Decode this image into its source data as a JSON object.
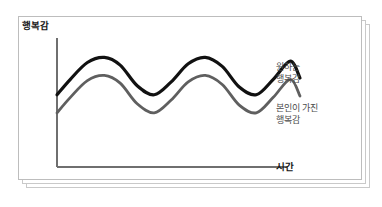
{
  "card": {
    "stack_count": 3,
    "border_color": "#bdbdbd",
    "background": "#ffffff"
  },
  "chart_data": {
    "type": "line",
    "title": "",
    "subtitle": "",
    "xlabel": "시간",
    "ylabel": "행복감",
    "grid": false,
    "legend_position": "right",
    "axis": {
      "x_axis_label": "시간",
      "y_axis_label": "행복감",
      "x_ticks": [],
      "y_ticks": [],
      "xlim": [
        0,
        10
      ],
      "ylim": [
        0,
        10
      ],
      "axis_color": "#6f6f6f"
    },
    "series": [
      {
        "name": "원하는 행복감",
        "name_lines": [
          "원하는",
          "행복감"
        ],
        "color": "#111111",
        "stroke_width": 3.2,
        "x": [
          0,
          0.55,
          1.25,
          1.95,
          2.6,
          3.3,
          4.0,
          4.7,
          5.4,
          6.1,
          6.8,
          7.5,
          8.2,
          8.9,
          9.6,
          10
        ],
        "values": [
          5.6,
          6.8,
          8.1,
          8.5,
          7.9,
          6.3,
          5.6,
          6.6,
          8.0,
          8.5,
          7.8,
          6.2,
          5.6,
          6.8,
          8.2,
          6.9
        ]
      },
      {
        "name": "본인이 가진 행복감",
        "name_lines": [
          "본인이 가진",
          "행복감"
        ],
        "color": "#5f5f5f",
        "stroke_width": 2.8,
        "x": [
          0,
          0.55,
          1.25,
          1.95,
          2.6,
          3.3,
          4.0,
          4.7,
          5.4,
          6.1,
          6.8,
          7.5,
          8.2,
          8.9,
          9.6,
          10
        ],
        "values": [
          4.2,
          5.4,
          6.7,
          7.1,
          6.5,
          4.9,
          4.2,
          5.2,
          6.6,
          7.1,
          6.4,
          4.8,
          4.2,
          5.4,
          6.8,
          5.5
        ]
      }
    ],
    "annotations": []
  },
  "labels": {
    "y_axis": "행복감",
    "x_axis": "시간",
    "legend_desired_line1": "원하는",
    "legend_desired_line2": "행복감",
    "legend_actual_line1": "본인이 가진",
    "legend_actual_line2": "행복감"
  },
  "colors": {
    "desired_curve": "#111111",
    "actual_curve": "#5f5f5f",
    "axis": "#6f6f6f",
    "text_primary": "#161616",
    "text_secondary": "#4a4a4a",
    "card_border": "#bdbdbd"
  }
}
